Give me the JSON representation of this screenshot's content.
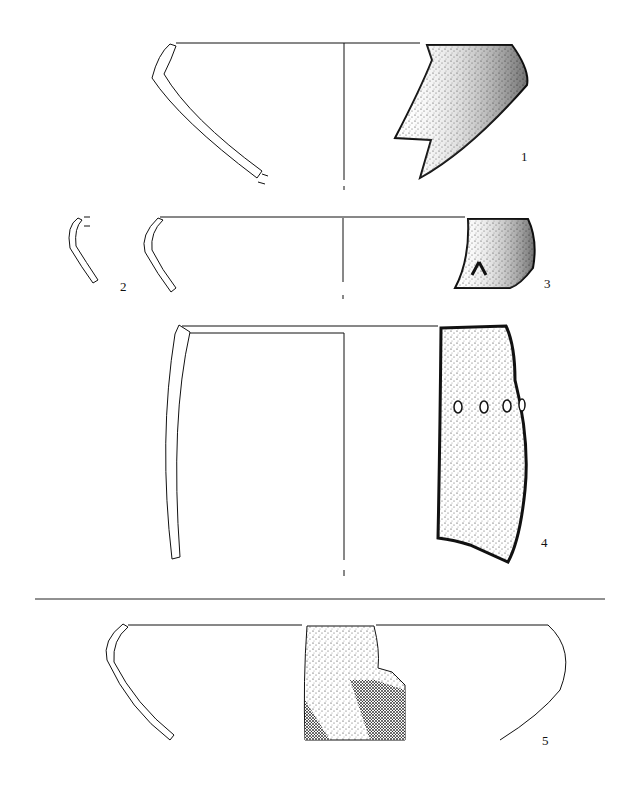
{
  "figure": {
    "type": "archaeological pottery drawing",
    "vessels": [
      {
        "id": "1",
        "label": "1",
        "views": [
          "profile-section",
          "exterior-fragment"
        ]
      },
      {
        "id": "2",
        "label": "2",
        "views": [
          "profile-section"
        ]
      },
      {
        "id": "3",
        "label": "3",
        "views": [
          "profile-section",
          "exterior-fragment"
        ]
      },
      {
        "id": "4",
        "label": "4",
        "views": [
          "profile-section",
          "exterior-fragment-perforated"
        ]
      },
      {
        "id": "5",
        "label": "5",
        "views": [
          "profile-section",
          "exterior-fragment-brushed",
          "reconstructed-outline"
        ]
      }
    ]
  },
  "colors": {
    "ink": "#111111",
    "background": "#ffffff"
  }
}
